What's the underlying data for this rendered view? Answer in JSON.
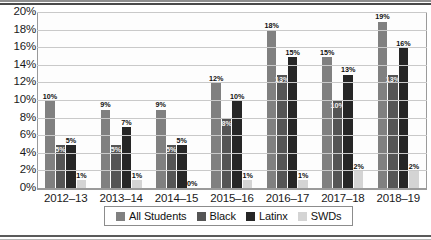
{
  "chart_data": {
    "type": "bar",
    "title": "",
    "xlabel": "",
    "ylabel": "",
    "ylim": [
      0,
      20
    ],
    "yticks": [
      "0%",
      "2%",
      "4%",
      "6%",
      "8%",
      "10%",
      "12%",
      "14%",
      "16%",
      "18%",
      "20%"
    ],
    "grid": true,
    "legend_position": "bottom",
    "categories": [
      "2012–13",
      "2013–14",
      "2014–15",
      "2015–16",
      "2016–17",
      "2017–18",
      "2018–19"
    ],
    "series": [
      {
        "name": "All Students",
        "color": "#808080",
        "values": [
          10,
          9,
          9,
          12,
          18,
          15,
          19
        ],
        "labels": [
          "10%",
          "9%",
          "9%",
          "12%",
          "18%",
          "15%",
          "19%"
        ]
      },
      {
        "name": "Black",
        "color": "#555555",
        "values": [
          5,
          5,
          5,
          8,
          13,
          10,
          13
        ],
        "labels": [
          "5%",
          "5%",
          "5%",
          "8%",
          "13%",
          "10%",
          "13%"
        ]
      },
      {
        "name": "Latinx",
        "color": "#262626",
        "values": [
          5,
          7,
          5,
          10,
          15,
          13,
          16
        ],
        "labels": [
          "5%",
          "7%",
          "5%",
          "10%",
          "15%",
          "13%",
          "16%"
        ]
      },
      {
        "name": "SWDs",
        "color": "#d4d4d4",
        "values": [
          1,
          1,
          0,
          1,
          1,
          2,
          2
        ],
        "labels": [
          "1%",
          "1%",
          "0%",
          "1%",
          "1%",
          "2%",
          "2%"
        ]
      }
    ]
  },
  "legend": {
    "items": [
      {
        "label": "All Students",
        "color": "#808080"
      },
      {
        "label": "Black",
        "color": "#555555"
      },
      {
        "label": "Latinx",
        "color": "#262626"
      },
      {
        "label": "SWDs",
        "color": "#d4d4d4"
      }
    ]
  }
}
